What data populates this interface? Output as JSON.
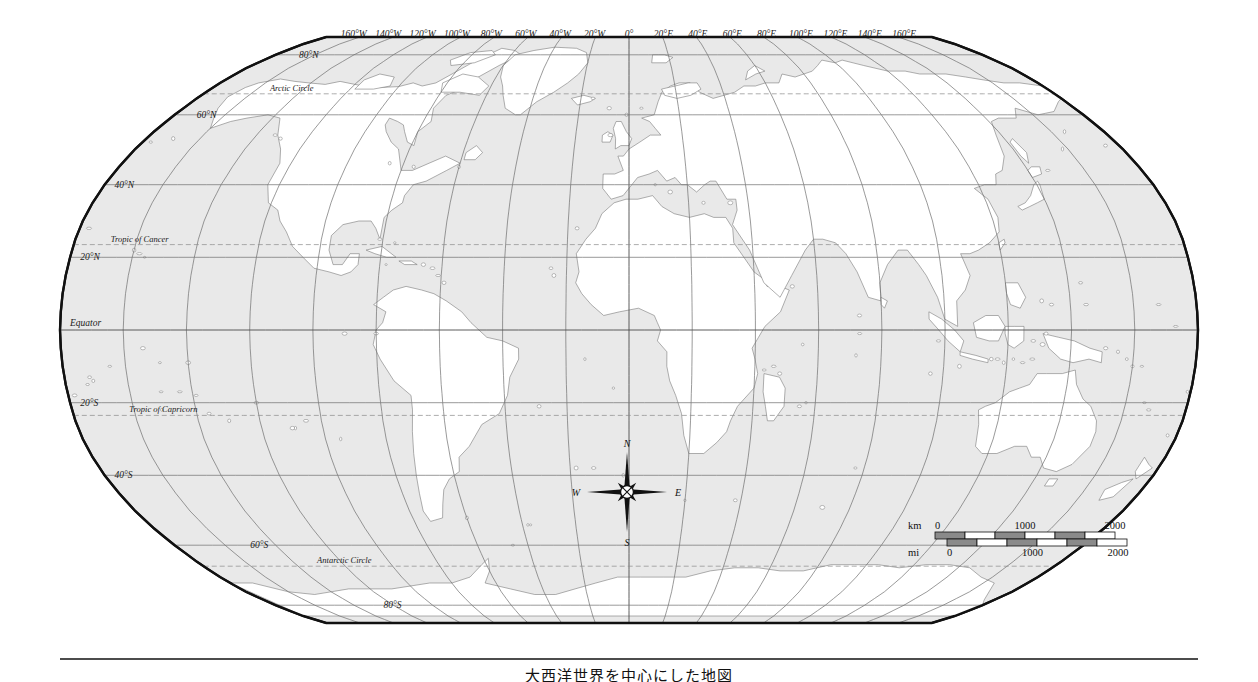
{
  "map": {
    "title": "大西洋世界を中心にした地図",
    "projection": "robinson",
    "ocean_color": "#e9e9e9",
    "land_color": "#ffffff",
    "border_color": "#7a7a7a",
    "frame_color": "#111111",
    "graticule_color": "#6f6f6f"
  },
  "longitude_labels": [
    {
      "text": "160°W",
      "lon": -160
    },
    {
      "text": "140°W",
      "lon": -140
    },
    {
      "text": "120°W",
      "lon": -120
    },
    {
      "text": "100°W",
      "lon": -100
    },
    {
      "text": "80°W",
      "lon": -80
    },
    {
      "text": "60°W",
      "lon": -60
    },
    {
      "text": "40°W",
      "lon": -40
    },
    {
      "text": "20°W",
      "lon": -20
    },
    {
      "text": "0°",
      "lon": 0
    },
    {
      "text": "20°E",
      "lon": 20
    },
    {
      "text": "40°E",
      "lon": 40
    },
    {
      "text": "60°E",
      "lon": 60
    },
    {
      "text": "80°E",
      "lon": 80
    },
    {
      "text": "100°E",
      "lon": 100
    },
    {
      "text": "120°E",
      "lon": 120
    },
    {
      "text": "140°E",
      "lon": 140
    },
    {
      "text": "160°E",
      "lon": 160
    }
  ],
  "latitude_labels": [
    {
      "text": "80°N",
      "lat": 80
    },
    {
      "text": "60°N",
      "lat": 60
    },
    {
      "text": "40°N",
      "lat": 40
    },
    {
      "text": "20°N",
      "lat": 20
    },
    {
      "text": "Equator",
      "lat": 0
    },
    {
      "text": "20°S",
      "lat": -20
    },
    {
      "text": "40°S",
      "lat": -40
    },
    {
      "text": "60°S",
      "lat": -60
    },
    {
      "text": "80°S",
      "lat": -80
    }
  ],
  "special_lines": [
    {
      "text": "Arctic Circle",
      "lat": 66.5
    },
    {
      "text": "Tropic of Cancer",
      "lat": 23.5
    },
    {
      "text": "Tropic of Capricorn",
      "lat": -23.5
    },
    {
      "text": "Antarctic Circle",
      "lat": -66.5
    }
  ],
  "compass": {
    "north": "N",
    "east": "E",
    "south": "S",
    "west": "W"
  },
  "scale_bar": {
    "km_label": "km",
    "mi_label": "mi",
    "km_ticks": [
      "0",
      "1000",
      "2000"
    ],
    "mi_ticks": [
      "0",
      "1000",
      "2000"
    ]
  }
}
